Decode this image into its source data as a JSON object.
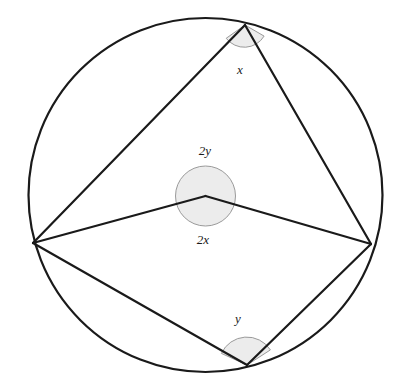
{
  "figure": {
    "name": "circle-theorem-diagram",
    "background_color": "#ffffff",
    "stroke_color": "#1a1a1a",
    "shade_fill": "#ececec",
    "shade_stroke": "#9a9a9a",
    "circle": {
      "cx": 205.5,
      "cy": 195,
      "r": 177,
      "stroke_width": 2.2
    },
    "center_point": {
      "cx": 205.5,
      "cy": 196,
      "label": "O"
    },
    "vertices": {
      "top": {
        "x": 245,
        "y": 25
      },
      "left": {
        "x": 33,
        "y": 243
      },
      "right": {
        "x": 371,
        "y": 244
      },
      "bottom": {
        "x": 247,
        "y": 365
      }
    },
    "chords": [
      {
        "name": "top-to-left",
        "x1": 245,
        "y1": 25,
        "x2": 33,
        "y2": 243
      },
      {
        "name": "top-to-right",
        "x1": 245,
        "y1": 25,
        "x2": 371,
        "y2": 244
      },
      {
        "name": "left-to-center",
        "x1": 33,
        "y1": 243,
        "x2": 205.5,
        "y2": 196
      },
      {
        "name": "right-to-center",
        "x1": 371,
        "y1": 244,
        "x2": 205.5,
        "y2": 196
      },
      {
        "name": "left-to-bottom",
        "x1": 33,
        "y1": 243,
        "x2": 247,
        "y2": 365
      },
      {
        "name": "right-to-bottom",
        "x1": 371,
        "y1": 244,
        "x2": 247,
        "y2": 365
      }
    ],
    "angle_markers": [
      {
        "name": "inscribed-angle-x",
        "label": "x",
        "vertex": {
          "x": 245,
          "y": 25
        },
        "radius": 23,
        "label_x": 240,
        "label_y": 71
      },
      {
        "name": "central-angle-2y",
        "label": "2y",
        "vertex": {
          "x": 205.5,
          "y": 196
        },
        "radius": 30,
        "label_x": 205,
        "label_y": 152
      },
      {
        "name": "central-angle-2x",
        "label": "2x",
        "vertex": {
          "x": 205.5,
          "y": 196
        },
        "radius": 30,
        "label_x": 203,
        "label_y": 241
      },
      {
        "name": "inscribed-angle-y",
        "label": "y",
        "vertex": {
          "x": 247,
          "y": 365
        },
        "radius": 28,
        "label_x": 238,
        "label_y": 320
      }
    ]
  }
}
